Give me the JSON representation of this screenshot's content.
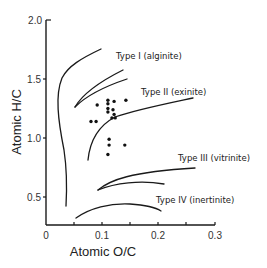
{
  "chart_data": {
    "type": "scatter",
    "title": "",
    "xlabel": "Atomic O/C",
    "ylabel": "Atomic H/C",
    "xlim": [
      0,
      0.3
    ],
    "ylim": [
      0.27,
      2.0
    ],
    "grid": false,
    "legend": null,
    "x_ticks": [
      "0",
      "0.1",
      "0.2",
      "0.3"
    ],
    "x_minor_ticks": [
      0.05,
      0.15,
      0.25
    ],
    "y_ticks": [
      "0.5",
      "1.0",
      "1.5",
      "2.0"
    ],
    "annotations": [
      {
        "text": "Type I  (alginite)",
        "x": 0.14,
        "y": 1.58
      },
      {
        "text": "Type II  (exinite)",
        "x": 0.165,
        "y": 1.34
      },
      {
        "text": "Type III  (vitrinite)",
        "x": 0.22,
        "y": 0.86
      },
      {
        "text": "Type IV  (inertinite)",
        "x": 0.2,
        "y": 0.47
      }
    ],
    "series": [
      {
        "name": "samples",
        "points": [
          {
            "x": 0.091,
            "y": 1.28
          },
          {
            "x": 0.11,
            "y": 1.32
          },
          {
            "x": 0.11,
            "y": 1.29
          },
          {
            "x": 0.11,
            "y": 1.25
          },
          {
            "x": 0.11,
            "y": 1.22
          },
          {
            "x": 0.121,
            "y": 1.31
          },
          {
            "x": 0.142,
            "y": 1.32
          },
          {
            "x": 0.119,
            "y": 1.24
          },
          {
            "x": 0.121,
            "y": 1.2
          },
          {
            "x": 0.117,
            "y": 1.17
          },
          {
            "x": 0.123,
            "y": 1.17
          },
          {
            "x": 0.08,
            "y": 1.14
          },
          {
            "x": 0.089,
            "y": 1.14
          },
          {
            "x": 0.112,
            "y": 0.99
          },
          {
            "x": 0.112,
            "y": 0.94
          },
          {
            "x": 0.11,
            "y": 0.86
          },
          {
            "x": 0.14,
            "y": 0.94
          }
        ]
      }
    ],
    "boundary_curves": [
      {
        "name": "Type I envelope",
        "shape": "outer arc from (0.10,1.75) down to (0.035,0.38)"
      },
      {
        "name": "Type II upper limb",
        "shape": "from (0.075,1.27) to (0.145,1.57)"
      },
      {
        "name": "Type II lower limb",
        "shape": "from (0.075,1.27) to (0.15,1.49)"
      },
      {
        "name": "Type II/III boundary",
        "shape": "arc from (0.075,0.81) to (0.27,1.02)"
      },
      {
        "name": "Type III upper limb",
        "shape": "from (0.095,0.54) to (0.27,0.75)"
      },
      {
        "name": "Type III lower limb",
        "shape": "from (0.095,0.54) to (0.205,0.62)"
      },
      {
        "name": "Type IV boundary",
        "shape": "arc from (0.05,0.30) to (0.195,0.44)"
      }
    ]
  }
}
